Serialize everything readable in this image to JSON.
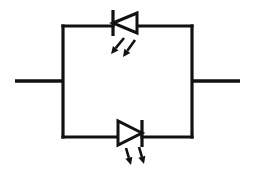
{
  "diagram": {
    "type": "circuit-schematic",
    "background_color": "#ffffff",
    "line_color": "#111111",
    "canvas": {
      "width": 255,
      "height": 173
    },
    "loop": {
      "name": "parallel-branch-rectangle",
      "left": 63,
      "top": 26,
      "right": 192,
      "bottom": 137,
      "stroke_width": 3.2
    },
    "terminals": [
      {
        "name": "left-terminal-lead",
        "side": "left",
        "x1": 15,
        "y1": 81,
        "x2": 63,
        "y2": 81
      },
      {
        "name": "right-terminal-lead",
        "side": "right",
        "x1": 192,
        "y1": 81,
        "x2": 240,
        "y2": 81
      }
    ],
    "components": [
      {
        "name": "led-top",
        "label": "",
        "kind": "light-emitting-diode",
        "branch": "top",
        "orientation": "pointing-left",
        "anode_side": "right",
        "cathode_side": "left",
        "triangle": {
          "apex_x": 113,
          "apex_y": 23,
          "back_x": 137,
          "back_top_y": 13,
          "back_bottom_y": 33
        },
        "cathode_bar": {
          "x": 113,
          "y1": 10,
          "y2": 36
        },
        "emission_arrows": [
          {
            "name": "light-arrow-1",
            "x1": 124,
            "y1": 38,
            "x2": 111,
            "y2": 54
          },
          {
            "name": "light-arrow-2",
            "x1": 135,
            "y1": 40,
            "x2": 123,
            "y2": 57
          }
        ]
      },
      {
        "name": "led-bottom",
        "label": "",
        "kind": "light-emitting-diode",
        "branch": "bottom",
        "orientation": "pointing-right",
        "anode_side": "left",
        "cathode_side": "right",
        "triangle": {
          "apex_x": 142,
          "apex_y": 133,
          "back_x": 118,
          "back_top_y": 121,
          "back_bottom_y": 145
        },
        "cathode_bar": {
          "x": 142,
          "y1": 120,
          "y2": 147
        },
        "emission_arrows": [
          {
            "name": "light-arrow-1",
            "x1": 126,
            "y1": 148,
            "x2": 131,
            "y2": 165
          },
          {
            "name": "light-arrow-2",
            "x1": 139,
            "y1": 147,
            "x2": 144,
            "y2": 164
          }
        ]
      }
    ]
  }
}
